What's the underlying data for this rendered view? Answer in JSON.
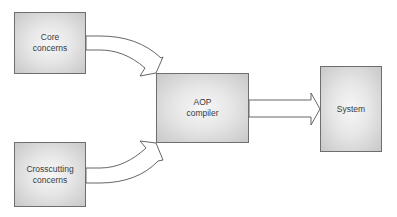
{
  "diagram": {
    "nodes": [
      {
        "id": "core",
        "label": "Core\nconcerns"
      },
      {
        "id": "crosscutting",
        "label": "Crosscutting\nconcerns"
      },
      {
        "id": "aop",
        "label": "AOP\ncompiler"
      },
      {
        "id": "system",
        "label": "System"
      }
    ],
    "edges": [
      {
        "from": "core",
        "to": "aop"
      },
      {
        "from": "crosscutting",
        "to": "aop"
      },
      {
        "from": "aop",
        "to": "system"
      }
    ],
    "colors": {
      "border": "#6e6e6e",
      "fill_center": "#f7f7f7",
      "fill_edge": "#c8c8c8",
      "arrow_stroke": "#555555",
      "text": "#3a3a3a"
    }
  }
}
